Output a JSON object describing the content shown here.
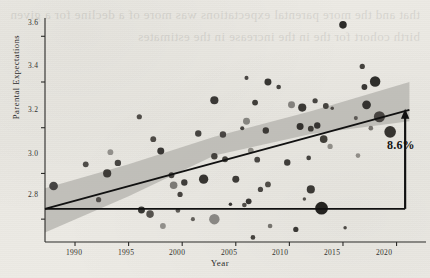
{
  "chart_data": {
    "type": "scatter",
    "title": "",
    "xlabel": "Year",
    "ylabel": "Parental Expectations",
    "xlim": [
      1987.2,
      2022.0
    ],
    "ylim": [
      2.7,
      3.68
    ],
    "xticks": [
      1990,
      1995,
      2000,
      2005,
      2010,
      2015,
      2020
    ],
    "xticklabels": [
      "1990",
      "1995",
      "2000",
      "2005",
      "2010",
      "2015",
      "2020"
    ],
    "yticks": [
      2.8,
      3.0,
      3.2,
      3.4,
      3.6
    ],
    "yticklabels": [
      "2.8",
      "3.0",
      "3.2",
      "3.4",
      "3.6"
    ],
    "grid": false,
    "legend": null,
    "annotations": [
      {
        "name": "change-annotation",
        "text": "8.6%",
        "x": 2021.0,
        "y": 3.02
      }
    ],
    "reference_line": {
      "name": "baseline-hline",
      "y": 2.845,
      "x_start": 1987.2,
      "x_end": 2020.8,
      "color": "#111111"
    },
    "arrow": {
      "name": "growth-arrow",
      "x": 2020.8,
      "y_start": 2.845,
      "y_end": 3.27,
      "color": "#111111",
      "double_headed": false
    },
    "fit_line": {
      "name": "regression-line",
      "color": "#111111",
      "x": [
        1987.2,
        2021.2
      ],
      "y": [
        2.845,
        3.278
      ]
    },
    "confidence_band": {
      "name": "confidence-band",
      "color": "#b3b1ac",
      "opacity": 0.75,
      "x": [
        1987.2,
        1995.0,
        2003.0,
        2012.0,
        2021.2
      ],
      "upper": [
        2.935,
        3.04,
        3.16,
        3.272,
        3.4
      ],
      "lower": [
        2.742,
        2.9,
        3.078,
        3.172,
        3.228
      ]
    },
    "series": [
      {
        "name": "districts",
        "marker": "circle",
        "size_meaning": "sample size",
        "points": [
          {
            "x": 1988.0,
            "y": 2.945,
            "s": 7.5,
            "c": "#3c3a39"
          },
          {
            "x": 1991.0,
            "y": 3.04,
            "s": 5.0,
            "c": "#45423f"
          },
          {
            "x": 1992.2,
            "y": 2.885,
            "s": 4.5,
            "c": "#4a4744"
          },
          {
            "x": 1993.0,
            "y": 3.0,
            "s": 7.0,
            "c": "#35332f"
          },
          {
            "x": 1993.3,
            "y": 3.093,
            "s": 5.0,
            "c": "#8c8a86"
          },
          {
            "x": 1994.0,
            "y": 3.046,
            "s": 5.5,
            "c": "#3e3b38"
          },
          {
            "x": 1996.0,
            "y": 3.248,
            "s": 4.5,
            "c": "#46433f"
          },
          {
            "x": 1996.2,
            "y": 2.84,
            "s": 6.0,
            "c": "#2c2a27"
          },
          {
            "x": 1997.0,
            "y": 2.822,
            "s": 6.5,
            "c": "#4b4844"
          },
          {
            "x": 1997.3,
            "y": 3.15,
            "s": 5.0,
            "c": "#43403c"
          },
          {
            "x": 1998.0,
            "y": 3.098,
            "s": 6.0,
            "c": "#2f2d2a"
          },
          {
            "x": 1998.2,
            "y": 2.77,
            "s": 5.0,
            "c": "#8b8985"
          },
          {
            "x": 1999.0,
            "y": 2.992,
            "s": 5.0,
            "c": "#3a3835"
          },
          {
            "x": 1999.2,
            "y": 2.948,
            "s": 6.5,
            "c": "#75736f"
          },
          {
            "x": 1999.6,
            "y": 2.838,
            "s": 4.0,
            "c": "#55524e"
          },
          {
            "x": 1999.8,
            "y": 2.908,
            "s": 4.5,
            "c": "#3b3835"
          },
          {
            "x": 2000.2,
            "y": 2.96,
            "s": 5.5,
            "c": "#343230"
          },
          {
            "x": 2001.0,
            "y": 2.8,
            "s": 3.5,
            "c": "#5a5753"
          },
          {
            "x": 2001.5,
            "y": 3.175,
            "s": 5.5,
            "c": "#3b3936"
          },
          {
            "x": 2002.0,
            "y": 2.975,
            "s": 8.0,
            "c": "#2a2825"
          },
          {
            "x": 2003.0,
            "y": 3.32,
            "s": 7.0,
            "c": "#2f2d2b"
          },
          {
            "x": 2003.0,
            "y": 3.075,
            "s": 5.5,
            "c": "#3a3834"
          },
          {
            "x": 2003.0,
            "y": 2.8,
            "s": 9.0,
            "c": "#83817d"
          },
          {
            "x": 2003.8,
            "y": 3.17,
            "s": 5.5,
            "c": "#403d3a"
          },
          {
            "x": 2004.0,
            "y": 3.062,
            "s": 5.0,
            "c": "#36342f"
          },
          {
            "x": 2004.5,
            "y": 2.865,
            "s": 3.0,
            "c": "#2e2c29"
          },
          {
            "x": 2005.0,
            "y": 2.975,
            "s": 6.0,
            "c": "#32302d"
          },
          {
            "x": 2005.6,
            "y": 3.198,
            "s": 3.5,
            "c": "#3c3936"
          },
          {
            "x": 2005.8,
            "y": 2.862,
            "s": 4.0,
            "c": "#46433f"
          },
          {
            "x": 2006.0,
            "y": 3.418,
            "s": 3.5,
            "c": "#3f3c39"
          },
          {
            "x": 2006.0,
            "y": 3.228,
            "s": 6.0,
            "c": "#807e7a"
          },
          {
            "x": 2006.2,
            "y": 2.878,
            "s": 5.0,
            "c": "#2d2b28"
          },
          {
            "x": 2006.4,
            "y": 3.1,
            "s": 5.0,
            "c": "#88867f"
          },
          {
            "x": 2006.6,
            "y": 2.72,
            "s": 4.0,
            "c": "#3a3834"
          },
          {
            "x": 2006.8,
            "y": 3.31,
            "s": 5.0,
            "c": "#35332f"
          },
          {
            "x": 2007.0,
            "y": 3.06,
            "s": 5.0,
            "c": "#3e3b38"
          },
          {
            "x": 2007.3,
            "y": 2.93,
            "s": 4.5,
            "c": "#413e3a"
          },
          {
            "x": 2007.8,
            "y": 3.188,
            "s": 5.5,
            "c": "#33312d"
          },
          {
            "x": 2008.0,
            "y": 3.4,
            "s": 6.0,
            "c": "#2c2a27"
          },
          {
            "x": 2008.0,
            "y": 2.952,
            "s": 5.0,
            "c": "#47443f"
          },
          {
            "x": 2008.2,
            "y": 2.77,
            "s": 4.0,
            "c": "#6e6c67"
          },
          {
            "x": 2009.0,
            "y": 3.378,
            "s": 4.0,
            "c": "#3c3936"
          },
          {
            "x": 2009.8,
            "y": 3.048,
            "s": 5.5,
            "c": "#34322f"
          },
          {
            "x": 2010.2,
            "y": 3.3,
            "s": 6.0,
            "c": "#7d7b77"
          },
          {
            "x": 2010.6,
            "y": 2.755,
            "s": 4.5,
            "c": "#302e2b"
          },
          {
            "x": 2011.0,
            "y": 3.205,
            "s": 6.0,
            "c": "#2a2825"
          },
          {
            "x": 2011.2,
            "y": 3.288,
            "s": 7.0,
            "c": "#2f2d29"
          },
          {
            "x": 2011.4,
            "y": 2.888,
            "s": 3.0,
            "c": "#4a4743"
          },
          {
            "x": 2011.8,
            "y": 3.068,
            "s": 4.0,
            "c": "#3a3835"
          },
          {
            "x": 2012.0,
            "y": 3.196,
            "s": 5.0,
            "c": "#34322e"
          },
          {
            "x": 2012.0,
            "y": 2.93,
            "s": 7.0,
            "c": "#312f2c"
          },
          {
            "x": 2012.4,
            "y": 3.318,
            "s": 4.5,
            "c": "#3d3a37"
          },
          {
            "x": 2012.6,
            "y": 3.21,
            "s": 5.5,
            "c": "#2d2b28"
          },
          {
            "x": 2013.0,
            "y": 2.848,
            "s": 11.0,
            "c": "#171614"
          },
          {
            "x": 2013.2,
            "y": 3.15,
            "s": 6.5,
            "c": "#36342f"
          },
          {
            "x": 2013.4,
            "y": 3.295,
            "s": 5.0,
            "c": "#3b3935"
          },
          {
            "x": 2013.8,
            "y": 3.118,
            "s": 4.5,
            "c": "#8a8883"
          },
          {
            "x": 2014.0,
            "y": 3.285,
            "s": 3.0,
            "c": "#45423e"
          },
          {
            "x": 2015.0,
            "y": 3.65,
            "s": 6.5,
            "c": "#201f1d"
          },
          {
            "x": 2015.2,
            "y": 2.762,
            "s": 3.0,
            "c": "#43403c"
          },
          {
            "x": 2016.2,
            "y": 3.242,
            "s": 3.5,
            "c": "#56534f"
          },
          {
            "x": 2016.4,
            "y": 3.078,
            "s": 4.0,
            "c": "#8a8782"
          },
          {
            "x": 2016.8,
            "y": 3.468,
            "s": 4.5,
            "c": "#393733"
          },
          {
            "x": 2017.0,
            "y": 3.378,
            "s": 5.0,
            "c": "#2e2c29"
          },
          {
            "x": 2017.2,
            "y": 3.3,
            "s": 7.5,
            "c": "#2b2926"
          },
          {
            "x": 2017.6,
            "y": 3.198,
            "s": 4.0,
            "c": "#6e6b67"
          },
          {
            "x": 2018.0,
            "y": 3.402,
            "s": 9.0,
            "c": "#232220"
          },
          {
            "x": 2018.4,
            "y": 3.248,
            "s": 9.5,
            "c": "#403d39"
          },
          {
            "x": 2019.4,
            "y": 3.182,
            "s": 10.0,
            "c": "#2a2825"
          }
        ]
      }
    ]
  },
  "bleed_text": "that and the more parental expectations was more of a decline for a given birth cohort for the in the increase in the estimates"
}
